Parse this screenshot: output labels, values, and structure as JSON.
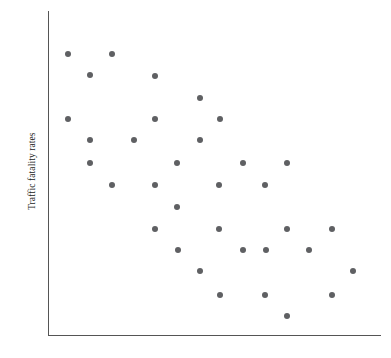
{
  "chart_data": {
    "type": "scatter",
    "title": "",
    "xlabel": "",
    "ylabel": "Traffic fatality rates",
    "grid": false,
    "legend": null,
    "xlim": [
      0,
      100
    ],
    "ylim": [
      0,
      100
    ],
    "marker": {
      "shape": "circle",
      "color": "#5f6063",
      "size_px": 6
    },
    "axis_color": "#555555",
    "background": "#ffffff",
    "n_points": 36,
    "points_px": [
      {
        "x": 68,
        "y": 54
      },
      {
        "x": 112,
        "y": 54
      },
      {
        "x": 90,
        "y": 75
      },
      {
        "x": 155,
        "y": 76
      },
      {
        "x": 200,
        "y": 98
      },
      {
        "x": 68,
        "y": 119
      },
      {
        "x": 155,
        "y": 119
      },
      {
        "x": 220,
        "y": 119
      },
      {
        "x": 90,
        "y": 140
      },
      {
        "x": 134,
        "y": 140
      },
      {
        "x": 200,
        "y": 140
      },
      {
        "x": 90,
        "y": 163
      },
      {
        "x": 177,
        "y": 163
      },
      {
        "x": 243,
        "y": 163
      },
      {
        "x": 287,
        "y": 163
      },
      {
        "x": 112,
        "y": 185
      },
      {
        "x": 155,
        "y": 185
      },
      {
        "x": 219,
        "y": 185
      },
      {
        "x": 265,
        "y": 185
      },
      {
        "x": 177,
        "y": 207
      },
      {
        "x": 155,
        "y": 229
      },
      {
        "x": 219,
        "y": 229
      },
      {
        "x": 287,
        "y": 229
      },
      {
        "x": 332,
        "y": 229
      },
      {
        "x": 178,
        "y": 250
      },
      {
        "x": 243,
        "y": 250
      },
      {
        "x": 266,
        "y": 250
      },
      {
        "x": 309,
        "y": 250
      },
      {
        "x": 200,
        "y": 271
      },
      {
        "x": 353,
        "y": 271
      },
      {
        "x": 220,
        "y": 295
      },
      {
        "x": 265,
        "y": 295
      },
      {
        "x": 332,
        "y": 295
      },
      {
        "x": 287,
        "y": 316
      }
    ],
    "x": [
      6.2,
      25.0,
      15.6,
      43.5,
      62.8,
      6.2,
      43.5,
      71.4,
      15.6,
      34.4,
      62.8,
      15.6,
      52.7,
      80.9,
      99.7,
      25.0,
      43.5,
      71.0,
      90.6,
      52.7,
      43.5,
      71.0,
      99.7,
      118.9,
      53.1,
      80.9,
      90.6,
      108.9,
      62.8,
      128.0,
      71.4,
      90.6,
      118.9,
      99.7
    ],
    "y": [
      93.9,
      93.9,
      87.4,
      87.1,
      80.4,
      73.7,
      73.7,
      73.7,
      67.2,
      67.2,
      67.2,
      60.0,
      60.0,
      60.0,
      60.0,
      53.1,
      53.1,
      53.1,
      53.1,
      46.2,
      39.4,
      39.4,
      39.4,
      39.4,
      32.8,
      32.8,
      32.8,
      32.8,
      26.3,
      26.3,
      18.8,
      18.8,
      18.8,
      12.2
    ]
  },
  "axes": {
    "y_axis": {
      "left": 48,
      "top": 11,
      "width": 1,
      "height": 325
    },
    "x_axis": {
      "left": 48,
      "top": 335,
      "width": 333,
      "height": 1
    }
  },
  "labels": {
    "y_axis_title": "Traffic fatality rates"
  }
}
